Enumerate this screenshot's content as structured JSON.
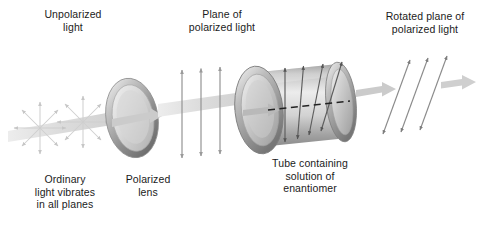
{
  "figure": {
    "background_color": "#ffffff",
    "text_color": "#1b1b1b"
  },
  "labels": {
    "unpolarized_light": "Unpolarized\nlight",
    "plane_of_polarized_light": "Plane of\npolarized light",
    "rotated_plane_of_polarized_light": "Rotated plane of\npolarized light",
    "ordinary_light_vibrates": "Ordinary\nlight vibrates\nin all planes",
    "polarized_lens": "Polarized\nlens",
    "tube_containing_solution": "Tube containing\nsolution of\nenantiomer"
  },
  "stages": [
    {
      "name": "light-source",
      "description": "Ordinary light vibrating in all planes",
      "glyph": "starburst",
      "count": 2,
      "spokes": 8
    },
    {
      "name": "polarized-lens",
      "description": "Polarizing filter disc",
      "glyph": "ellipse-disc"
    },
    {
      "name": "plane-polarized-beam",
      "description": "Vertical double-headed arrows, plane polarized",
      "glyph": "double-arrow",
      "count": 3,
      "angle_degrees": 90
    },
    {
      "name": "sample-tube",
      "description": "Cylindrical tube containing solution of enantiomer",
      "glyph": "cylinder",
      "internal_arrows": 4,
      "internal_arrow_angles_degrees": [
        90,
        80,
        70,
        60
      ],
      "reference_line": "dashed"
    },
    {
      "name": "rotated-beam",
      "description": "Double-headed arrows rotated from vertical",
      "glyph": "double-arrow",
      "count": 3,
      "angle_degrees": 68
    }
  ],
  "colors": {
    "beam": "#d9d9d9",
    "arrow_stroke": "#8a8a8a",
    "dark_arrow_stroke": "#4a4a4a",
    "disc_rim": "#9b9b9b",
    "disc_face": "#c9c9c9",
    "tube_body": "#b5b5b5",
    "dashed_line": "#2a2a2a",
    "starburst": "#cfcfcf"
  }
}
